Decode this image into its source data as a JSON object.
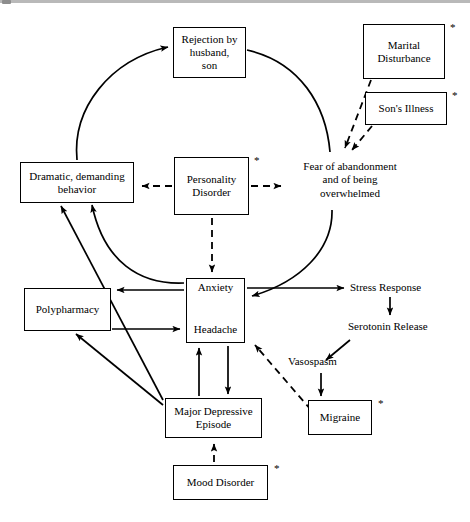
{
  "figure": {
    "kind": "causal-loop-diagram",
    "title_text": "",
    "background_color": "#ffffff",
    "line_color": "#000000",
    "asterisk_glyph": "*"
  },
  "nodes": {
    "rejection": {
      "label": "Rejection by\nhusband,\nson",
      "boxed": true,
      "starred": false,
      "x": 173,
      "y": 27,
      "w": 73,
      "h": 51
    },
    "marital": {
      "label": "Marital\nDisturbance",
      "boxed": true,
      "starred": true,
      "x": 363,
      "y": 24,
      "w": 82,
      "h": 55
    },
    "sons_illness": {
      "label": "Son's Illness",
      "boxed": true,
      "starred": true,
      "x": 365,
      "y": 92,
      "w": 82,
      "h": 33
    },
    "dramatic": {
      "label": "Dramatic, demanding\nbehavior",
      "boxed": true,
      "starred": false,
      "x": 20,
      "y": 162,
      "w": 114,
      "h": 41
    },
    "personality": {
      "label": "Personality\nDisorder",
      "boxed": true,
      "starred": true,
      "x": 174,
      "y": 157,
      "w": 75,
      "h": 58
    },
    "fear": {
      "label": "Fear of abandonment\nand of being\noverwhelmed",
      "boxed": false,
      "starred": false,
      "x": 288,
      "y": 160,
      "w": 124,
      "h": 45
    },
    "polypharmacy": {
      "label": "Polypharmacy",
      "boxed": true,
      "starred": false,
      "x": 24,
      "y": 288,
      "w": 87,
      "h": 43
    },
    "anxiety": {
      "label": "Anxiety",
      "boxed": false,
      "starred": false,
      "x": 186,
      "y": 278,
      "w": 59,
      "h": 18
    },
    "headache": {
      "label": "Headache",
      "boxed": false,
      "starred": false,
      "x": 186,
      "y": 322,
      "w": 59,
      "h": 20
    },
    "anxiety_headache_box": {
      "label": "",
      "boxed": true,
      "starred": false,
      "x": 186,
      "y": 278,
      "w": 59,
      "h": 65
    },
    "stress_response": {
      "label": "Stress Response",
      "boxed": false,
      "starred": false,
      "x": 350,
      "y": 281,
      "w": 96,
      "h": 16
    },
    "serotonin": {
      "label": "Serotonin Release",
      "boxed": false,
      "starred": false,
      "x": 348,
      "y": 320,
      "w": 104,
      "h": 16
    },
    "vasospasm": {
      "label": "Vasospasm",
      "boxed": false,
      "starred": false,
      "x": 288,
      "y": 355,
      "w": 68,
      "h": 16
    },
    "migraine": {
      "label": "Migraine",
      "boxed": true,
      "starred": true,
      "x": 308,
      "y": 400,
      "w": 64,
      "h": 35
    },
    "mde": {
      "label": "Major Depressive\nEpisode",
      "boxed": true,
      "starred": false,
      "x": 165,
      "y": 398,
      "w": 97,
      "h": 40
    },
    "mood_disorder": {
      "label": "Mood Disorder",
      "boxed": true,
      "starred": true,
      "x": 173,
      "y": 465,
      "w": 95,
      "h": 35
    }
  },
  "edges": [
    {
      "from": "dramatic",
      "to": "rejection",
      "style": "solid",
      "shape": "arc"
    },
    {
      "from": "rejection",
      "to": "fear",
      "style": "solid",
      "shape": "arc"
    },
    {
      "from": "fear",
      "to": "anxiety",
      "style": "solid",
      "shape": "arc"
    },
    {
      "from": "anxiety",
      "to": "dramatic",
      "style": "solid",
      "shape": "arc"
    },
    {
      "from": "marital",
      "to": "fear",
      "style": "dashed",
      "shape": "straight"
    },
    {
      "from": "sons_illness",
      "to": "fear",
      "style": "dashed",
      "shape": "straight"
    },
    {
      "from": "personality",
      "to": "dramatic",
      "style": "dashed",
      "shape": "straight"
    },
    {
      "from": "personality",
      "to": "fear",
      "style": "dashed",
      "shape": "straight"
    },
    {
      "from": "personality",
      "to": "anxiety",
      "style": "dashed",
      "shape": "straight"
    },
    {
      "from": "anxiety",
      "to": "headache",
      "style": "solid",
      "shape": "double-arrow"
    },
    {
      "from": "anxiety",
      "to": "polypharmacy",
      "style": "solid",
      "shape": "straight"
    },
    {
      "from": "polypharmacy",
      "to": "headache",
      "style": "solid",
      "shape": "straight"
    },
    {
      "from": "polypharmacy",
      "to": "dramatic",
      "style": "solid",
      "shape": "straight"
    },
    {
      "from": "mde",
      "to": "polypharmacy",
      "style": "solid",
      "shape": "straight"
    },
    {
      "from": "mde",
      "to": "dramatic",
      "style": "solid",
      "shape": "straight"
    },
    {
      "from": "mde",
      "to": "headache",
      "style": "solid",
      "shape": "straight"
    },
    {
      "from": "headache",
      "to": "mde",
      "style": "solid",
      "shape": "straight"
    },
    {
      "from": "mood_disorder",
      "to": "mde",
      "style": "dashed",
      "shape": "straight"
    },
    {
      "from": "anxiety",
      "to": "stress_response",
      "style": "solid",
      "shape": "straight"
    },
    {
      "from": "stress_response",
      "to": "serotonin",
      "style": "solid",
      "shape": "straight"
    },
    {
      "from": "serotonin",
      "to": "vasospasm",
      "style": "solid",
      "shape": "straight"
    },
    {
      "from": "vasospasm",
      "to": "migraine",
      "style": "solid",
      "shape": "straight"
    },
    {
      "from": "migraine",
      "to": "headache",
      "style": "dashed",
      "shape": "straight"
    }
  ]
}
